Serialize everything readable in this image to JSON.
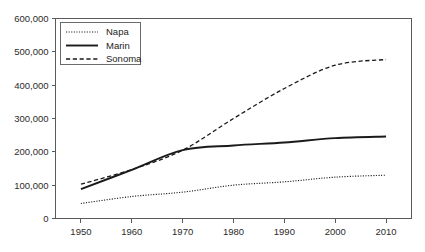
{
  "chart_data": {
    "type": "line",
    "title": "",
    "subtitle": "",
    "xlabel": "",
    "ylabel": "",
    "x": [
      1950,
      1960,
      1970,
      1980,
      1990,
      2000,
      2010
    ],
    "xlim": [
      1945,
      2015
    ],
    "ylim": [
      0,
      600000
    ],
    "grid": false,
    "legend_position": "top-left-inside",
    "x_tick_labels": [
      "1950",
      "1960",
      "1970",
      "1980",
      "1990",
      "2000",
      "2010"
    ],
    "y_tick_labels": [
      "0",
      "100,000",
      "200,000",
      "300,000",
      "400,000",
      "500,000",
      "600,000"
    ],
    "y_ticks": [
      0,
      100000,
      200000,
      300000,
      400000,
      500000,
      600000
    ],
    "series": [
      {
        "name": "Napa",
        "style": "dotted",
        "color": "#1a1a1a",
        "values": [
          45000,
          66000,
          79000,
          100000,
          110000,
          124000,
          130000
        ]
      },
      {
        "name": "Marin",
        "style": "solid",
        "color": "#1a1a1a",
        "values": [
          88000,
          146000,
          205000,
          219000,
          228000,
          241000,
          246000
        ]
      },
      {
        "name": "Sonoma",
        "style": "dashed",
        "color": "#1a1a1a",
        "values": [
          103000,
          147000,
          205000,
          300000,
          390000,
          460000,
          477000
        ]
      }
    ]
  },
  "legend": {
    "items": [
      {
        "label": "Napa",
        "style": "dotted"
      },
      {
        "label": "Marin",
        "style": "solid"
      },
      {
        "label": "Sonoma",
        "style": "dashed"
      }
    ]
  },
  "colors": {
    "background": "#ffffff",
    "axis": "#5a5a5a",
    "series": "#1a1a1a",
    "text": "#2b2b2b",
    "legend_border": "#6b6b6b"
  }
}
